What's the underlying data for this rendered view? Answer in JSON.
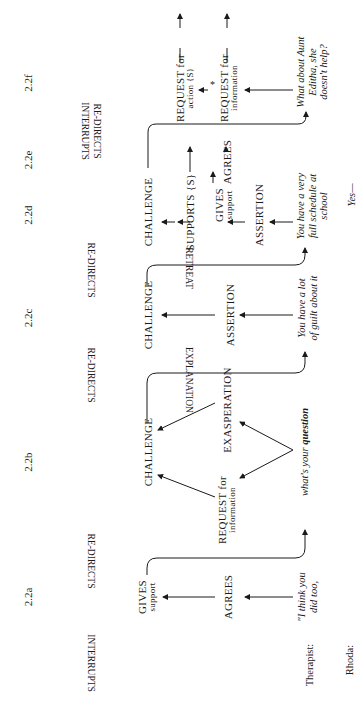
{
  "sections": [
    "2.2a",
    "2.2b",
    "2.2c",
    "2.2d",
    "2.2e",
    "2.2f"
  ],
  "top_labels": {
    "interrupts_a": "INTERRUPTS",
    "redirects_a": "RE-DIRECTS",
    "redirects_b": "RE-DIRECTS",
    "redirects_c": "RE-DIRECTS",
    "interrupts_f": "INTERRUPTS",
    "redirects_f": "RE-DIRECTS"
  },
  "connectors": {
    "explanation": "EXPLANATION",
    "retreat": "RETREAT"
  },
  "nodes": {
    "a_gives": "GIVES",
    "a_gives_sub": "support",
    "a_agrees": "AGREES",
    "b_challenge": "CHALLENGE",
    "b_request": "REQUEST for",
    "b_request_sub": "information",
    "b_exasperation": "EXASPERATION",
    "c_challenge": "CHALLENGE",
    "c_assertion": "ASSERTION",
    "d_challenge": "CHALLENGE",
    "d_supports": "SUPPORTS {S}",
    "d_gives": "GIVES",
    "d_gives_sub": "support",
    "d_assertion": "ASSERTION",
    "e_agrees": "AGREES",
    "f_req_action": "REQUEST for",
    "f_req_action_sub": "action {S}",
    "f_star": "*",
    "f_req_info": "REQUEST for",
    "f_req_info_sub": "information"
  },
  "utterances": {
    "a": [
      "\"I think you",
      "did too,"
    ],
    "b": [
      "what's your ",
      "question"
    ],
    "c": [
      "You have a lot",
      "of guilt about it"
    ],
    "d": [
      "You have a very",
      "full schedule at",
      "school"
    ],
    "f": [
      "What about Aunt",
      "Editha, she",
      "doesn't help?"
    ],
    "rhoda": "Yes—"
  },
  "speakers": {
    "therapist": "Therapist:",
    "rhoda": "Rhoda:"
  }
}
